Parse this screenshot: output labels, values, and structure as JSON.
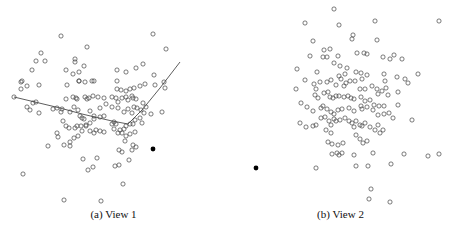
{
  "figure": {
    "panels": [
      {
        "id": "a",
        "caption": "(a)  View 1"
      },
      {
        "id": "b",
        "caption": "(b)  View 2"
      }
    ]
  },
  "chart_data": [
    {
      "type": "scatter",
      "title": "(a) View 1",
      "xlabel": "",
      "ylabel": "",
      "grid": false,
      "axes_visible": false,
      "marker": "open-circle",
      "highlight_point": {
        "x": 153,
        "y": 149,
        "style": "filled"
      },
      "curve": [
        [
          14,
          97
        ],
        [
          60,
          108
        ],
        [
          82,
          114
        ],
        [
          112,
          121
        ],
        [
          128,
          124
        ],
        [
          142,
          110
        ],
        [
          160,
          88
        ],
        [
          180,
          62
        ]
      ],
      "points": [
        [
          61,
          36
        ],
        [
          153,
          34
        ],
        [
          87,
          47
        ],
        [
          166,
          49
        ],
        [
          41,
          53
        ],
        [
          36,
          61
        ],
        [
          45,
          61
        ],
        [
          75,
          59
        ],
        [
          75,
          62
        ],
        [
          32,
          70
        ],
        [
          66,
          70
        ],
        [
          79,
          72
        ],
        [
          84,
          66
        ],
        [
          117,
          70
        ],
        [
          126,
          72
        ],
        [
          136,
          68
        ],
        [
          143,
          64
        ],
        [
          73,
          74
        ],
        [
          79,
          81
        ],
        [
          117,
          81
        ],
        [
          154,
          75
        ],
        [
          21,
          82
        ],
        [
          22,
          81
        ],
        [
          21,
          89
        ],
        [
          27,
          86
        ],
        [
          39,
          85
        ],
        [
          67,
          85
        ],
        [
          79,
          81
        ],
        [
          85,
          82
        ],
        [
          92,
          81
        ],
        [
          94,
          81
        ],
        [
          117,
          89
        ],
        [
          121,
          90
        ],
        [
          126,
          91
        ],
        [
          130,
          89
        ],
        [
          134,
          88
        ],
        [
          140,
          86
        ],
        [
          145,
          84
        ],
        [
          155,
          85
        ],
        [
          164,
          82
        ],
        [
          165,
          88
        ],
        [
          14,
          97
        ],
        [
          27,
          107
        ],
        [
          30,
          110
        ],
        [
          33,
          103
        ],
        [
          36,
          102
        ],
        [
          39,
          113
        ],
        [
          53,
          109
        ],
        [
          57,
          108
        ],
        [
          62,
          109
        ],
        [
          61,
          112
        ],
        [
          66,
          99
        ],
        [
          73,
          97
        ],
        [
          76,
          98
        ],
        [
          77,
          99
        ],
        [
          85,
          97
        ],
        [
          87,
          99
        ],
        [
          89,
          98
        ],
        [
          93,
          96
        ],
        [
          98,
          97
        ],
        [
          104,
          98
        ],
        [
          112,
          97
        ],
        [
          116,
          98
        ],
        [
          118,
          102
        ],
        [
          122,
          98
        ],
        [
          126,
          97
        ],
        [
          128,
          100
        ],
        [
          132,
          96
        ],
        [
          133,
          98
        ],
        [
          136,
          99
        ],
        [
          143,
          103
        ],
        [
          151,
          114
        ],
        [
          162,
          112
        ],
        [
          70,
          112
        ],
        [
          74,
          107
        ],
        [
          78,
          110
        ],
        [
          80,
          116
        ],
        [
          82,
          118
        ],
        [
          84,
          119
        ],
        [
          90,
          111
        ],
        [
          94,
          116
        ],
        [
          100,
          117
        ],
        [
          100,
          108
        ],
        [
          106,
          104
        ],
        [
          112,
          107
        ],
        [
          118,
          108
        ],
        [
          124,
          112
        ],
        [
          128,
          109
        ],
        [
          132,
          113
        ],
        [
          134,
          107
        ],
        [
          137,
          108
        ],
        [
          141,
          110
        ],
        [
          146,
          107
        ],
        [
          144,
          113
        ],
        [
          63,
          121
        ],
        [
          66,
          126
        ],
        [
          69,
          128
        ],
        [
          75,
          128
        ],
        [
          77,
          126
        ],
        [
          81,
          126
        ],
        [
          86,
          125
        ],
        [
          90,
          123
        ],
        [
          94,
          119
        ],
        [
          104,
          116
        ],
        [
          112,
          124
        ],
        [
          114,
          122
        ],
        [
          116,
          124
        ],
        [
          120,
          130
        ],
        [
          124,
          129
        ],
        [
          126,
          126
        ],
        [
          130,
          124
        ],
        [
          133,
          124
        ],
        [
          135,
          120
        ],
        [
          140,
          118
        ],
        [
          142,
          123
        ],
        [
          48,
          146
        ],
        [
          58,
          137
        ],
        [
          57,
          133
        ],
        [
          64,
          145
        ],
        [
          70,
          142
        ],
        [
          70,
          146
        ],
        [
          74,
          138
        ],
        [
          78,
          136
        ],
        [
          82,
          131
        ],
        [
          86,
          126
        ],
        [
          90,
          131
        ],
        [
          94,
          133
        ],
        [
          96,
          130
        ],
        [
          100,
          131
        ],
        [
          104,
          132
        ],
        [
          114,
          129
        ],
        [
          118,
          133
        ],
        [
          122,
          133
        ],
        [
          126,
          136
        ],
        [
          130,
          134
        ],
        [
          135,
          132
        ],
        [
          125,
          141
        ],
        [
          133,
          145
        ],
        [
          136,
          147
        ],
        [
          132,
          150
        ],
        [
          122,
          152
        ],
        [
          119,
          150
        ],
        [
          129,
          160
        ],
        [
          83,
          159
        ],
        [
          97,
          158
        ],
        [
          88,
          170
        ],
        [
          93,
          167
        ],
        [
          115,
          166
        ],
        [
          119,
          165
        ],
        [
          123,
          184
        ],
        [
          23,
          174
        ],
        [
          64,
          200
        ],
        [
          101,
          201
        ]
      ]
    },
    {
      "type": "scatter",
      "title": "(b) View 2",
      "xlabel": "",
      "ylabel": "",
      "grid": false,
      "axes_visible": false,
      "marker": "open-circle",
      "highlight_point": {
        "x": 256,
        "y": 168,
        "style": "filled"
      },
      "points": [
        [
          334,
          9
        ],
        [
          305,
          23
        ],
        [
          339,
          25
        ],
        [
          375,
          21
        ],
        [
          439,
          21
        ],
        [
          353,
          35
        ],
        [
          352,
          39
        ],
        [
          313,
          41
        ],
        [
          377,
          40
        ],
        [
          310,
          56
        ],
        [
          324,
          50
        ],
        [
          330,
          49
        ],
        [
          323,
          57
        ],
        [
          327,
          57
        ],
        [
          338,
          56
        ],
        [
          357,
          53
        ],
        [
          364,
          53
        ],
        [
          367,
          54
        ],
        [
          383,
          57
        ],
        [
          390,
          59
        ],
        [
          394,
          55
        ],
        [
          402,
          59
        ],
        [
          297,
          69
        ],
        [
          317,
          72
        ],
        [
          334,
          63
        ],
        [
          340,
          66
        ],
        [
          347,
          68
        ],
        [
          339,
          76
        ],
        [
          341,
          79
        ],
        [
          345,
          74
        ],
        [
          356,
          72
        ],
        [
          361,
          73
        ],
        [
          362,
          79
        ],
        [
          367,
          75
        ],
        [
          384,
          74
        ],
        [
          385,
          81
        ],
        [
          397,
          77
        ],
        [
          405,
          79
        ],
        [
          408,
          83
        ],
        [
          418,
          74
        ],
        [
          305,
          80
        ],
        [
          296,
          89
        ],
        [
          314,
          84
        ],
        [
          316,
          89
        ],
        [
          320,
          82
        ],
        [
          327,
          82
        ],
        [
          331,
          80
        ],
        [
          336,
          85
        ],
        [
          344,
          86
        ],
        [
          346,
          83
        ],
        [
          350,
          81
        ],
        [
          355,
          81
        ],
        [
          360,
          89
        ],
        [
          365,
          89
        ],
        [
          372,
          86
        ],
        [
          377,
          89
        ],
        [
          378,
          94
        ],
        [
          382,
          91
        ],
        [
          386,
          88
        ],
        [
          388,
          95
        ],
        [
          398,
          92
        ],
        [
          315,
          95
        ],
        [
          318,
          98
        ],
        [
          324,
          93
        ],
        [
          328,
          92
        ],
        [
          330,
          97
        ],
        [
          333,
          98
        ],
        [
          336,
          96
        ],
        [
          339,
          96
        ],
        [
          344,
          97
        ],
        [
          348,
          96
        ],
        [
          351,
          98
        ],
        [
          354,
          99
        ],
        [
          361,
          97
        ],
        [
          365,
          101
        ],
        [
          370,
          100
        ],
        [
          374,
          105
        ],
        [
          379,
          106
        ],
        [
          384,
          106
        ],
        [
          398,
          105
        ],
        [
          301,
          103
        ],
        [
          307,
          107
        ],
        [
          313,
          111
        ],
        [
          321,
          108
        ],
        [
          323,
          106
        ],
        [
          327,
          109
        ],
        [
          331,
          112
        ],
        [
          334,
          114
        ],
        [
          338,
          110
        ],
        [
          342,
          109
        ],
        [
          349,
          108
        ],
        [
          354,
          111
        ],
        [
          361,
          106
        ],
        [
          362,
          109
        ],
        [
          367,
          107
        ],
        [
          373,
          110
        ],
        [
          378,
          115
        ],
        [
          384,
          114
        ],
        [
          389,
          113
        ],
        [
          393,
          118
        ],
        [
          412,
          120
        ],
        [
          300,
          123
        ],
        [
          306,
          127
        ],
        [
          313,
          126
        ],
        [
          316,
          125
        ],
        [
          321,
          118
        ],
        [
          325,
          117
        ],
        [
          329,
          121
        ],
        [
          331,
          125
        ],
        [
          334,
          119
        ],
        [
          336,
          121
        ],
        [
          340,
          120
        ],
        [
          345,
          118
        ],
        [
          349,
          121
        ],
        [
          352,
          123
        ],
        [
          354,
          127
        ],
        [
          356,
          121
        ],
        [
          360,
          125
        ],
        [
          362,
          126
        ],
        [
          365,
          123
        ],
        [
          370,
          127
        ],
        [
          375,
          130
        ],
        [
          378,
          125
        ],
        [
          380,
          133
        ],
        [
          383,
          130
        ],
        [
          326,
          130
        ],
        [
          331,
          133
        ],
        [
          328,
          142
        ],
        [
          332,
          144
        ],
        [
          338,
          145
        ],
        [
          343,
          143
        ],
        [
          356,
          135
        ],
        [
          360,
          139
        ],
        [
          363,
          143
        ],
        [
          367,
          141
        ],
        [
          332,
          154
        ],
        [
          337,
          153
        ],
        [
          339,
          155
        ],
        [
          342,
          153
        ],
        [
          354,
          155
        ],
        [
          373,
          153
        ],
        [
          391,
          164
        ],
        [
          404,
          154
        ],
        [
          428,
          156
        ],
        [
          439,
          154
        ],
        [
          316,
          168
        ],
        [
          356,
          166
        ],
        [
          368,
          166
        ],
        [
          371,
          189
        ],
        [
          369,
          199
        ],
        [
          390,
          202
        ]
      ]
    }
  ]
}
